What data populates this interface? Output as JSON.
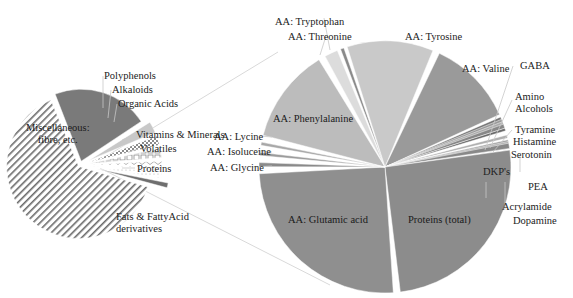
{
  "chart_data": [
    {
      "type": "pie",
      "title": "",
      "name": "overall-composition",
      "center": [
        80,
        165
      ],
      "radius": 72,
      "start_angle_deg": -112,
      "slices": [
        {
          "label": "Miscellaneous: fibre, etc.",
          "value": 22,
          "color": "#7a7a7a",
          "pattern": "solid-dark",
          "explode": 4
        },
        {
          "label": "Polyphenols",
          "value": 3,
          "color": "#c8c8c8",
          "pattern": "dots",
          "explode": 10
        },
        {
          "label": "Alkaloids",
          "value": 2.5,
          "color": "#bdbdbd",
          "pattern": "checker",
          "explode": 10
        },
        {
          "label": "Organic Acids",
          "value": 2.5,
          "color": "#d5d5d5",
          "pattern": "boxes",
          "explode": 10
        },
        {
          "label": "Vitamins & Minerals",
          "value": 2,
          "color": "#e0e0e0",
          "pattern": "waves",
          "explode": 10
        },
        {
          "label": "Volatiles",
          "value": 2,
          "color": "#e6e6e6",
          "pattern": "light",
          "explode": 10
        },
        {
          "label": "Proteins",
          "value": 1.5,
          "color": "#6e6e6e",
          "pattern": "solid-dark",
          "explode": 18
        },
        {
          "label": "Fats & FattyAcid derivatives",
          "value": 64.5,
          "color": "#ffffff",
          "pattern": "diagonal-stripes",
          "explode": 2
        }
      ]
    },
    {
      "type": "pie",
      "title": "",
      "name": "protein-breakdown",
      "center": [
        385,
        167
      ],
      "radius": 126,
      "start_angle_deg": -167,
      "slices": [
        {
          "label": "AA: Phenylalanine",
          "value": 12,
          "color": "#bcbcbc",
          "pattern": "dots"
        },
        {
          "label": "AA: Threonine",
          "value": 2.4,
          "color": "#dcdcdc",
          "pattern": "dots"
        },
        {
          "label": "AA: Tryptophan",
          "value": 0.4,
          "color": "#8a8a8a",
          "pattern": "solid"
        },
        {
          "label": "AA: Tyrosine",
          "value": 11,
          "color": "#c9c9c9",
          "pattern": "dots"
        },
        {
          "label": "AA: Valine",
          "value": 11,
          "color": "#9a9a9a",
          "pattern": "dots"
        },
        {
          "label": "GABA",
          "value": 0.3,
          "color": "#777777",
          "pattern": "solid"
        },
        {
          "label": "Amino Alcohols",
          "value": 0.3,
          "color": "#999999",
          "pattern": "solid"
        },
        {
          "label": "Tyramine",
          "value": 0.3,
          "color": "#aaaaaa",
          "pattern": "solid"
        },
        {
          "label": "Histamine",
          "value": 0.3,
          "color": "#888888",
          "pattern": "solid"
        },
        {
          "label": "Serotonin",
          "value": 0.5,
          "color": "#6a6a6a",
          "pattern": "solid"
        },
        {
          "label": "DKP's",
          "value": 1.2,
          "color": "#b0b0b0",
          "pattern": "solid"
        },
        {
          "label": "PEA",
          "value": 0.2,
          "color": "#999999",
          "pattern": "solid"
        },
        {
          "label": "Acrylamide",
          "value": 0.2,
          "color": "#aaaaaa",
          "pattern": "solid"
        },
        {
          "label": "Dopamine",
          "value": 0.2,
          "color": "#888888",
          "pattern": "solid"
        },
        {
          "label": "Proteins (total)",
          "value": 24,
          "color": "#8c8c8c",
          "pattern": "dots"
        },
        {
          "label": "AA: Glutamic acid",
          "value": 24,
          "color": "#8f8f8f",
          "pattern": "dots"
        },
        {
          "label": "AA: Glycine",
          "value": 1.3,
          "color": "#8a8a8a",
          "pattern": "dots"
        },
        {
          "label": "AA: Isoluceine",
          "value": 1.2,
          "color": "#9c9c9c",
          "pattern": "dots"
        },
        {
          "label": "AA: Lycine",
          "value": 1.2,
          "color": "#a8a8a8",
          "pattern": "dots"
        }
      ]
    }
  ],
  "labels": {
    "small": [
      {
        "text": "Miscellaneous:\nfibre, etc.",
        "x": 26,
        "y": 122,
        "inside": true
      },
      {
        "text": "Polyphenols",
        "x": 104,
        "y": 70
      },
      {
        "text": "Alkaloids",
        "x": 112,
        "y": 84
      },
      {
        "text": "Organic Acids",
        "x": 118,
        "y": 98
      },
      {
        "text": "Vitamins & Minerals",
        "x": 136,
        "y": 129
      },
      {
        "text": "Volatiles",
        "x": 140,
        "y": 143
      },
      {
        "text": "Proteins",
        "x": 137,
        "y": 163
      },
      {
        "text": "Fats & FattyAcid\nderivatives",
        "x": 116,
        "y": 211
      }
    ],
    "big": [
      {
        "text": "AA: Tryptophan",
        "x": 275,
        "y": 16
      },
      {
        "text": "AA: Threonine",
        "x": 288,
        "y": 31
      },
      {
        "text": "AA: Tyrosine",
        "x": 405,
        "y": 31
      },
      {
        "text": "AA: Valine",
        "x": 462,
        "y": 63
      },
      {
        "text": "GABA",
        "x": 520,
        "y": 60
      },
      {
        "text": "Amino\nAlcohols",
        "x": 515,
        "y": 91
      },
      {
        "text": "Tyramine",
        "x": 515,
        "y": 124
      },
      {
        "text": "Histamine",
        "x": 513,
        "y": 136
      },
      {
        "text": "Serotonin",
        "x": 511,
        "y": 149
      },
      {
        "text": "DKP's",
        "x": 483,
        "y": 166
      },
      {
        "text": "PEA",
        "x": 528,
        "y": 181
      },
      {
        "text": "Acrylamide",
        "x": 502,
        "y": 201
      },
      {
        "text": "Dopamine",
        "x": 513,
        "y": 215
      },
      {
        "text": "AA: Phenylalanine",
        "x": 273,
        "y": 113,
        "inside": true
      },
      {
        "text": "AA: Lycine",
        "x": 214,
        "y": 131
      },
      {
        "text": "AA: Isoluceine",
        "x": 207,
        "y": 146
      },
      {
        "text": "AA: Glycine",
        "x": 210,
        "y": 162
      },
      {
        "text": "AA: Glutamic acid",
        "x": 288,
        "y": 214,
        "inside": true
      },
      {
        "text": "Proteins (total)",
        "x": 408,
        "y": 214,
        "inside": true
      }
    ]
  },
  "colors": {
    "leader_line": "#c8c8c8",
    "connector_line": "#d9d9d9",
    "text": "#222222"
  }
}
